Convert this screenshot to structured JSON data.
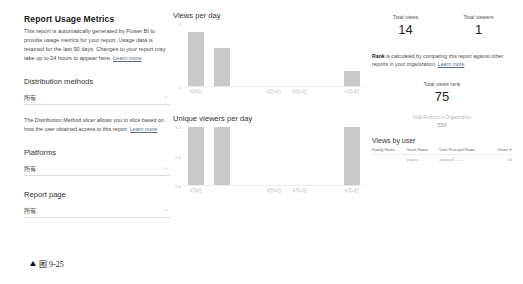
{
  "left": {
    "title": "Report Usage Metrics",
    "description": "This report is automatically generated by Power BI to provide usage metrics for your report. Usage data is retained for the last 90 days. Changes to your report may take up to 24 hours to appear here.",
    "learn_more": "Learn more",
    "sections": [
      {
        "label": "Distribution methods",
        "value": "所有",
        "description": "The Distribution Method slicer allows you to slice based on how the user obtained access to this report.",
        "learn_more": "Learn more"
      },
      {
        "label": "Platforms",
        "value": "所有",
        "description": "",
        "learn_more": ""
      },
      {
        "label": "Report page",
        "value": "所有",
        "description": "",
        "learn_more": ""
      }
    ]
  },
  "right": {
    "kpis": [
      {
        "label": "Total views",
        "value": "14"
      },
      {
        "label": "Total viewers",
        "value": "1"
      }
    ],
    "rank_note_bold": "Rank",
    "rank_note": " is calculated by comparing this report against other reports in your organization.",
    "rank_note_link": "Learn more",
    "rank_label": "Total views rank",
    "rank_value": "75",
    "org_label": "Total Reports in Organization",
    "org_value": "559",
    "table": {
      "title": "Views by user",
      "columns": [
        "Family Name",
        "Given Name",
        "User Principal Name",
        "Views"
      ],
      "sort_column": "Views",
      "rows": [
        [
          "",
          "wsaca",
          "aewca@-----  --",
          "14"
        ]
      ]
    }
  },
  "chart_data": [
    {
      "type": "bar",
      "title": "Views per day",
      "categories": [
        "9月8日",
        "9月9日",
        "9月10日",
        "9月11日",
        "9月12日",
        "9月13日",
        "9月14日"
      ],
      "tick_categories": [
        "9月8日",
        "9月11日",
        "9月12日",
        "9月14日"
      ],
      "values": [
        7,
        5,
        0,
        0,
        0,
        0,
        2
      ],
      "xlabel": "",
      "ylabel": "",
      "ylim": [
        0,
        8
      ],
      "yticks": [
        "5",
        "0"
      ],
      "grid": false,
      "legend": "none",
      "bar_color": "#c9c9c9"
    },
    {
      "type": "bar",
      "title": "Unique viewers per day",
      "categories": [
        "9月8日",
        "9月9日",
        "9月10日",
        "9月11日",
        "9月12日",
        "9月13日",
        "9月14日"
      ],
      "tick_categories": [
        "9月8日",
        "9月11日",
        "9月12日",
        "9月14日"
      ],
      "values": [
        1,
        1,
        0,
        0,
        0,
        0,
        1
      ],
      "xlabel": "",
      "ylabel": "",
      "ylim": [
        0,
        1
      ],
      "yticks": [
        "1.0",
        "0.5",
        "0.0"
      ],
      "grid": false,
      "legend": "none",
      "bar_color": "#c9c9c9"
    }
  ],
  "caption": {
    "text": "图 9-25"
  }
}
